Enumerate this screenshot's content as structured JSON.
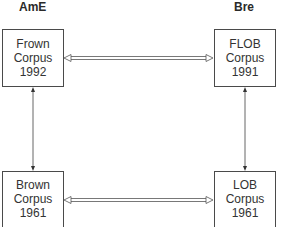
{
  "columns": {
    "left": {
      "label": "AmE"
    },
    "right": {
      "label": "Bre"
    }
  },
  "boxes": {
    "frown": {
      "name": "Frown",
      "type": "Corpus",
      "year": "1992"
    },
    "flob": {
      "name": "FLOB",
      "type": "Corpus",
      "year": "1991"
    },
    "brown": {
      "name": "Brown",
      "type": "Corpus",
      "year": "1961"
    },
    "lob": {
      "name": "LOB",
      "type": "Corpus",
      "year": "1961"
    }
  },
  "connections": [
    {
      "from": "frown",
      "to": "flob",
      "style": "double-hollow-bidirectional"
    },
    {
      "from": "brown",
      "to": "lob",
      "style": "double-hollow-bidirectional"
    },
    {
      "from": "frown",
      "to": "brown",
      "style": "single-line-bidirectional"
    },
    {
      "from": "flob",
      "to": "lob",
      "style": "single-line-bidirectional"
    }
  ],
  "colors": {
    "line": "#4a4a4a",
    "text": "#2a2a2a",
    "background": "#ffffff"
  }
}
